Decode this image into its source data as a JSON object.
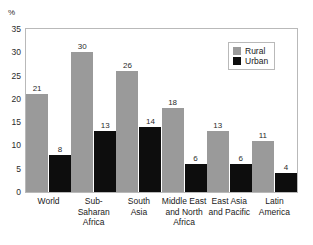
{
  "chart_data": {
    "type": "bar",
    "title": "",
    "subtitle": "",
    "xlabel": "",
    "ylabel": "%",
    "ylim": [
      0,
      35
    ],
    "yticks": [
      35,
      30,
      25,
      20,
      15,
      10,
      5,
      0
    ],
    "grid": false,
    "legend_position": "top-right",
    "categories": [
      "World",
      "Sub-\nSaharan\nAfrica",
      "South\nAsia",
      "Middle East\nand North\nAfrica",
      "East Asia\nand Pacific",
      "Latin\nAmerica"
    ],
    "series": [
      {
        "name": "Rural",
        "color": "#9a9a9a",
        "values": [
          21,
          30,
          26,
          18,
          13,
          11
        ]
      },
      {
        "name": "Urban",
        "color": "#0d0d0d",
        "values": [
          8,
          13,
          14,
          6,
          6,
          4
        ]
      }
    ]
  },
  "axis": {
    "unit_label": "%"
  },
  "colors": {
    "rural": "#9a9a9a",
    "urban": "#0d0d0d",
    "frame": "#b9b9b9",
    "text": "#1a1a1a",
    "background": "#ffffff"
  }
}
